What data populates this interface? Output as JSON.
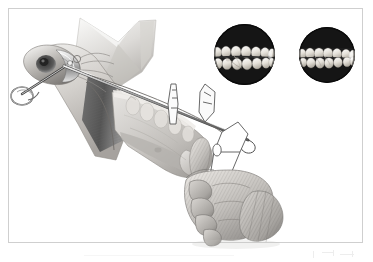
{
  "figure": {
    "kind": "medical-illustration",
    "title": "Intraoral approach to the mandible with condylar pin and retractors",
    "subject": "mandible",
    "technique": "grayscale airbrush rendering with line-drawing instrument overlays",
    "background_color": "#ffffff",
    "frame": {
      "visible": true,
      "border_color": "#cfcfcf",
      "border_width_px": 1,
      "inset_px": 8
    },
    "palette": {
      "bone_light": "#e8e6e3",
      "bone_mid": "#c9c6c2",
      "bone_shadow": "#9a9794",
      "muscle_dark": "#5c5c5c",
      "muscle_darker": "#474747",
      "metal_light": "#f2f2f2",
      "metal_mid": "#b5b5b5",
      "metal_dark": "#6b6b6b",
      "glove_light": "#dedbd7",
      "glove_mid": "#b9b6b2",
      "glove_shadow": "#8e8b88",
      "flap_light": "#efeeec",
      "flap_mid": "#cdcbc8",
      "outline": "#5a5a5a",
      "photo_background": "#151515",
      "tooth_enamel": "#f3f1ec",
      "tooth_shade": "#c8c4bb"
    },
    "labels": {
      "none_visible": true
    }
  },
  "illustration_parts": [
    {
      "id": "mandible-body",
      "name": "mandible-body",
      "description": "Lower jaw bone seen from the left side, angled from upper-left to lower-right"
    },
    {
      "id": "mandibular-ramus",
      "name": "mandibular-ramus",
      "description": "Vertical ascending branch of the jaw at the upper left of the bone"
    },
    {
      "id": "condyle-head",
      "name": "condyle-head",
      "description": "Rounded articular head at the far upper-left of the jaw"
    },
    {
      "id": "masseter-shading",
      "name": "masseter-muscle-shading",
      "description": "Dark gray vertical band over the ramus representing muscle attachment"
    },
    {
      "id": "tooth-row",
      "name": "mandibular-tooth-row",
      "description": "Row of lower teeth and exposed roots along the superior border of the jaw"
    },
    {
      "id": "condylar-pin",
      "name": "condylar-pin",
      "description": "Long slender metal pin driven through the condyle, with a ringed handle at far left"
    },
    {
      "id": "pin-ring-handle",
      "name": "pin-ring-handle",
      "description": "Small circular ring terminating the pin at the left edge"
    },
    {
      "id": "long-retractor",
      "name": "long-retractor-instrument",
      "description": "Long straight instrument shaft running diagonally across the jaw to the lower right"
    },
    {
      "id": "tissue-flap",
      "name": "retracted-tissue-flap",
      "description": "Pale retracted soft-tissue flap folded upward above the ramus"
    },
    {
      "id": "outline-retractor-right",
      "name": "outline-retractor-right",
      "description": "Line-drawn retractor blade outline at right, drawn without shading"
    },
    {
      "id": "outline-retractor-mid",
      "name": "outline-retractor-middle",
      "description": "Line-drawn narrow retractor standing vertically over the tooth row"
    },
    {
      "id": "gloved-hand",
      "name": "gloved-hand",
      "description": "Surgeon's gloved right hand gripping the chin from below with the thumb extended upward"
    },
    {
      "id": "glove-cuff",
      "name": "glove-cuff",
      "description": "Textured glove cuff at the lower right of the hand"
    }
  ],
  "photos": [
    {
      "id": "occlusal-photo-1",
      "name": "intraoral-photo-upper-and-lower-arch",
      "shape": "circle",
      "background": "#151515",
      "content": "Close-up intraoral photograph showing upper and lower posterior teeth meeting in occlusion, two rows visible",
      "rows": 2,
      "teeth_upper": 6,
      "teeth_lower": 6
    },
    {
      "id": "occlusal-photo-2",
      "name": "intraoral-photo-single-arch",
      "shape": "circle",
      "background": "#151515",
      "content": "Close-up intraoral photograph showing a single row of posterior teeth in near edge-to-edge contact",
      "rows": 2,
      "teeth_upper": 5,
      "teeth_lower": 5
    }
  ]
}
